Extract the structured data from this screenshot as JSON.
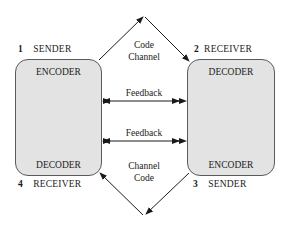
{
  "diagram": {
    "nodes": [
      {
        "id": "1",
        "number": "1",
        "role": "SENDER",
        "top_label": "ENCODER",
        "bottom_label": "DECODER",
        "bottom_number": "4",
        "bottom_role": "RECEIVER"
      },
      {
        "id": "2",
        "number": "2",
        "role": "RECEIVER",
        "top_label": "DECODER",
        "bottom_label": "ENCODER",
        "bottom_number": "3",
        "bottom_role": "SENDER"
      }
    ],
    "left": {
      "top_number": "1",
      "top_role": "SENDER",
      "inner_top": "ENCODER",
      "inner_bottom": "DECODER",
      "bottom_number": "4",
      "bottom_role": "RECEIVER"
    },
    "right": {
      "top_number": "2",
      "top_role": "RECEIVER",
      "inner_top": "DECODER",
      "inner_bottom": "ENCODER",
      "bottom_number": "3",
      "bottom_role": "SENDER"
    },
    "top_channel": {
      "line1": "Code",
      "line2": "Channel"
    },
    "bottom_channel": {
      "line1": "Channel",
      "line2": "Code"
    },
    "feedback": {
      "upper": "Feedback",
      "lower": "Feedback"
    },
    "colors": {
      "box_fill": "#e3e3e3",
      "stroke": "#1a1a1a"
    }
  }
}
